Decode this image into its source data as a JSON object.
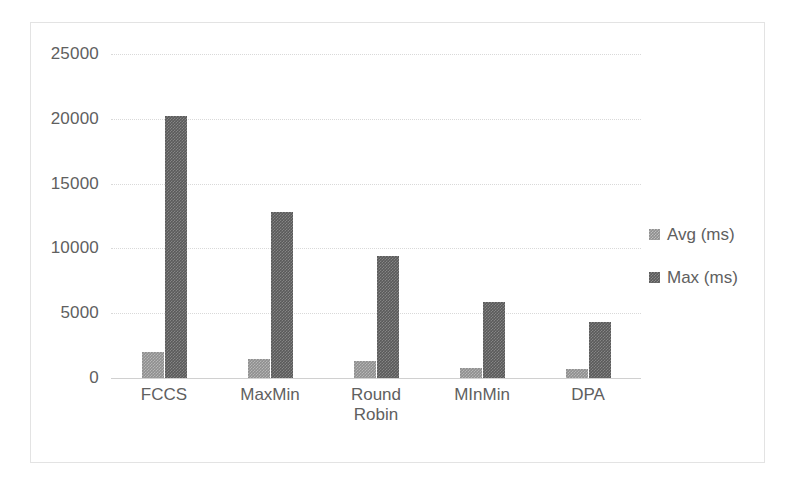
{
  "chart_data": {
    "type": "bar",
    "title": "",
    "xlabel": "",
    "ylabel": "",
    "categories": [
      "FCCS",
      "MaxMin",
      "Round\nRobin",
      "MInMin",
      "DPA"
    ],
    "series": [
      {
        "name": "Avg (ms)",
        "values": [
          2000,
          1450,
          1300,
          750,
          700
        ],
        "color": "#8f8f8f"
      },
      {
        "name": "Max (ms)",
        "values": [
          20200,
          12800,
          9400,
          5900,
          4300
        ],
        "color": "#5a5a5a"
      }
    ],
    "ylim": [
      0,
      25000
    ],
    "y_ticks": [
      0,
      5000,
      10000,
      15000,
      20000,
      25000
    ],
    "y_tick_labels": [
      "0",
      "5000",
      "10000",
      "15000",
      "20000",
      "25000"
    ],
    "grid": true,
    "legend_position": "right"
  },
  "legend": {
    "entries": [
      {
        "label": "Avg (ms)",
        "style": "avg"
      },
      {
        "label": "Max (ms)",
        "style": "max"
      }
    ]
  },
  "colors": {
    "avg_series": "#8f8f8f",
    "max_series": "#5a5a5a",
    "gridline": "#d9d9d9",
    "frame_border": "#e3e3e3",
    "text": "#606060"
  }
}
